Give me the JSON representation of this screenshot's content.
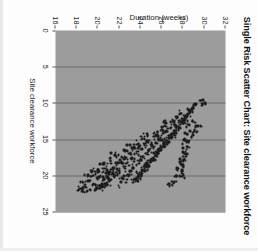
{
  "chart_data": {
    "type": "scatter",
    "title": "Single Risk Scatter Chart: Site clearance workforce",
    "xlabel": "Site clearance workforce",
    "ylabel": "Duration (weeks)",
    "xlim": [
      0,
      25
    ],
    "ylim": [
      16,
      32
    ],
    "xticks": [
      0,
      5,
      10,
      15,
      20,
      25
    ],
    "ytick_labels": [
      "32",
      "30",
      "28",
      "26",
      "24",
      "22",
      "20",
      "18",
      "16"
    ],
    "yticks": [
      32,
      30,
      28,
      26,
      24,
      22,
      20,
      18,
      16
    ],
    "y_axis_inverted": true,
    "grid": "vertical",
    "grid_color": "#6a6a6a",
    "plot_background": "#9c9c9c",
    "marker_color": "#1c1c1c",
    "legend": "none",
    "n_points": 620,
    "points": [
      [
        9.6,
        29.9
      ],
      [
        10.1,
        29.9
      ],
      [
        10.4,
        29.2
      ],
      [
        10.8,
        29.0
      ],
      [
        11.0,
        28.8
      ],
      [
        11.3,
        28.7
      ],
      [
        11.6,
        28.5
      ],
      [
        11.9,
        28.3
      ],
      [
        12.1,
        28.2
      ],
      [
        12.4,
        28.0
      ],
      [
        12.7,
        27.9
      ],
      [
        13.0,
        27.7
      ],
      [
        13.3,
        27.6
      ],
      [
        13.5,
        27.4
      ],
      [
        13.8,
        27.3
      ],
      [
        14.1,
        27.1
      ],
      [
        14.4,
        27.0
      ],
      [
        14.6,
        26.8
      ],
      [
        14.9,
        26.7
      ],
      [
        15.2,
        26.5
      ],
      [
        15.5,
        26.4
      ],
      [
        15.7,
        26.2
      ],
      [
        16.0,
        26.1
      ],
      [
        16.3,
        25.9
      ],
      [
        16.6,
        25.8
      ],
      [
        16.8,
        25.6
      ],
      [
        17.1,
        25.5
      ],
      [
        17.4,
        25.3
      ],
      [
        17.7,
        25.2
      ],
      [
        17.9,
        25.0
      ],
      [
        18.2,
        24.9
      ],
      [
        18.5,
        24.7
      ],
      [
        18.8,
        24.6
      ],
      [
        19.0,
        24.4
      ],
      [
        19.3,
        24.3
      ],
      [
        19.6,
        24.1
      ],
      [
        19.9,
        24.0
      ],
      [
        20.1,
        23.8
      ],
      [
        20.4,
        23.6
      ],
      [
        20.6,
        23.4
      ],
      [
        11.5,
        27.8
      ],
      [
        12.0,
        27.5
      ],
      [
        12.5,
        27.2
      ],
      [
        13.0,
        26.9
      ],
      [
        13.5,
        26.6
      ],
      [
        14.0,
        26.3
      ],
      [
        14.5,
        26.0
      ],
      [
        15.0,
        25.7
      ],
      [
        15.5,
        25.4
      ],
      [
        16.0,
        25.1
      ],
      [
        16.5,
        24.8
      ],
      [
        17.0,
        24.5
      ],
      [
        17.5,
        24.2
      ],
      [
        18.0,
        23.9
      ],
      [
        18.5,
        23.6
      ],
      [
        19.0,
        23.3
      ],
      [
        19.5,
        23.0
      ],
      [
        20.0,
        22.7
      ],
      [
        20.5,
        22.4
      ],
      [
        21.0,
        22.1
      ],
      [
        12.8,
        26.4
      ],
      [
        13.4,
        26.0
      ],
      [
        14.0,
        25.6
      ],
      [
        14.6,
        25.2
      ],
      [
        15.2,
        24.8
      ],
      [
        15.8,
        24.4
      ],
      [
        16.4,
        24.0
      ],
      [
        17.0,
        23.6
      ],
      [
        17.6,
        23.2
      ],
      [
        18.2,
        22.8
      ],
      [
        18.8,
        22.4
      ],
      [
        19.4,
        22.0
      ],
      [
        20.0,
        21.6
      ],
      [
        20.6,
        21.2
      ],
      [
        21.2,
        20.8
      ],
      [
        21.6,
        20.4
      ],
      [
        14.2,
        24.6
      ],
      [
        14.9,
        24.2
      ],
      [
        15.6,
        23.8
      ],
      [
        16.3,
        23.4
      ],
      [
        17.0,
        23.0
      ],
      [
        17.7,
        22.6
      ],
      [
        18.4,
        22.2
      ],
      [
        19.1,
        21.8
      ],
      [
        19.8,
        21.4
      ],
      [
        20.5,
        21.0
      ],
      [
        21.2,
        20.6
      ],
      [
        21.8,
        20.2
      ],
      [
        15.8,
        23.0
      ],
      [
        16.6,
        22.6
      ],
      [
        17.4,
        22.2
      ],
      [
        18.2,
        21.8
      ],
      [
        19.0,
        21.4
      ],
      [
        19.8,
        21.0
      ],
      [
        20.6,
        20.6
      ],
      [
        21.4,
        20.2
      ],
      [
        22.0,
        19.8
      ],
      [
        17.2,
        21.6
      ],
      [
        18.0,
        21.2
      ],
      [
        18.8,
        20.8
      ],
      [
        19.6,
        20.4
      ],
      [
        20.4,
        20.0
      ],
      [
        21.2,
        19.6
      ],
      [
        22.0,
        19.2
      ],
      [
        18.4,
        20.4
      ],
      [
        19.2,
        20.0
      ],
      [
        20.0,
        19.6
      ],
      [
        20.8,
        19.2
      ],
      [
        21.6,
        18.8
      ],
      [
        22.2,
        18.5
      ],
      [
        19.4,
        19.4
      ],
      [
        20.2,
        19.0
      ],
      [
        21.0,
        18.6
      ],
      [
        21.8,
        18.3
      ],
      [
        13.2,
        29.4
      ],
      [
        13.9,
        29.1
      ],
      [
        14.8,
        28.8
      ],
      [
        15.4,
        28.5
      ],
      [
        16.1,
        28.4
      ],
      [
        17.0,
        28.2
      ],
      [
        17.8,
        28.1
      ],
      [
        18.6,
        28.0
      ],
      [
        19.4,
        27.9
      ],
      [
        20.2,
        27.8
      ],
      [
        12.6,
        28.9
      ],
      [
        13.1,
        28.6
      ],
      [
        14.3,
        28.4
      ],
      [
        15.1,
        28.2
      ],
      [
        16.8,
        28.0
      ],
      [
        18.1,
        27.8
      ],
      [
        19.1,
        27.6
      ],
      [
        20.0,
        27.4
      ],
      [
        20.9,
        27.2
      ],
      [
        21.4,
        27.0
      ]
    ]
  }
}
